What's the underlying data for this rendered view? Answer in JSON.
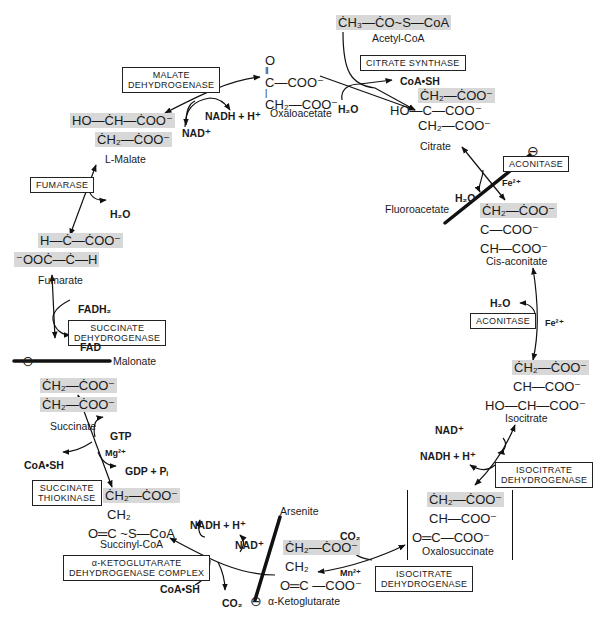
{
  "diagram": {
    "metabolites": {
      "acetyl_coa": {
        "formula": "ĊH₃—ĊO~S—CoA",
        "name": "Acetyl-CoA"
      },
      "oxaloacetate": {
        "line1": "O",
        "line2": "‖",
        "line3": "C—COO⁻",
        "line4": "|",
        "line5": "CH₂—COO⁻",
        "name": "Oxaloacetate"
      },
      "citrate": {
        "line1": "ĊH₂—ĊOO⁻",
        "line2": "HO—C—COO⁻",
        "line3": "CH₂—COO⁻",
        "name": "Citrate"
      },
      "cis_aconitate": {
        "line1": "ĊH₂—ĊOO⁻",
        "line2": "C—COO⁻",
        "line3": "CH—COO⁻",
        "name": "Cis-aconitate"
      },
      "isocitrate": {
        "line1": "ĊH₂—ĊOO⁻",
        "line2": "CH—COO⁻",
        "line3": "HO—CH—COO⁻",
        "name": "Isocitrate"
      },
      "oxalosuccinate": {
        "line1": "ĊH₂—ĊOO⁻",
        "line2": "CH—COO⁻",
        "line3": "O═C—COO⁻",
        "name": "Oxalosuccinate"
      },
      "alpha_ketoglutarate": {
        "line1": "ĊH₂—ĊOO⁻",
        "line2": "CH₂",
        "line3": "O═C —COO⁻",
        "name": "α-Ketoglutarate"
      },
      "succinyl_coa": {
        "line1": "ĊH₂—ĊOO⁻",
        "line2": "CH₂",
        "line3": "O═C ~S—CoA",
        "name": "Succinyl-CoA"
      },
      "succinate": {
        "line1": "ĊH₂—ĊOO⁻",
        "line2": "ĊH₂—ĊOO⁻",
        "name": "Succinate"
      },
      "fumarate": {
        "line1": "H—Ċ—ĊOO⁻",
        "line2": "⁻OOĊ—Ċ—H",
        "name": "Fumarate"
      },
      "malate": {
        "line1": "HO—ĊH—ĊOO⁻",
        "line2": "ĊH₂—ĊOO⁻",
        "name": "L-Malate"
      }
    },
    "enzymes": {
      "citrate_synthase": "CITRATE SYNTHASE",
      "aconitase_1": "ACONITASE",
      "aconitase_2": "ACONITASE",
      "isocitrate_dh_1_l1": "ISOCITRATE",
      "isocitrate_dh_1_l2": "DEHYDROGENASE",
      "isocitrate_dh_2_l1": "ISOCITRATE",
      "isocitrate_dh_2_l2": "DEHYDROGENASE",
      "akg_dh_l1": "α-KETOGLUTARATE",
      "akg_dh_l2": "DEHYDROGENASE COMPLEX",
      "succ_thiokinase_l1": "SUCCINATE",
      "succ_thiokinase_l2": "THIOKINASE",
      "succ_dh_l1": "SUCCINATE",
      "succ_dh_l2": "DEHYDROGENASE",
      "fumarase": "FUMARASE",
      "malate_dh_l1": "MALATE",
      "malate_dh_l2": "DEHYDROGENASE"
    },
    "cofactors": {
      "coash_top": "CoA•SH",
      "h2o_top": "H₂O",
      "nadh_malate": "NADH + H⁺",
      "nad_malate": "NAD⁺",
      "h2o_fumarase": "H₂O",
      "h2o_aconitase1": "H₂O",
      "fe_1": "Fe²⁺",
      "h2o_aconitase2": "H₂O",
      "fe_2": "Fe²⁺",
      "nad_isocitrate": "NAD⁺",
      "nadh_isocitrate": "NADH + H⁺",
      "co2_oxalosuccinate": "CO₂",
      "mn": "Mn²⁺",
      "nadh_akg": "NADH + H⁺",
      "nad_akg": "NAD⁺",
      "coash_akg": "CoA•SH",
      "co2_akg": "CO₂",
      "gtp": "GTP",
      "mg": "Mg²⁺",
      "gdp": "GDP + Pᵢ",
      "coash_succ": "CoA•SH",
      "fadh2": "FADH₂",
      "fad": "FAD"
    },
    "inhibitors": {
      "fluoroacetate": "Fluoroacetate",
      "malonate": "Malonate",
      "arsenite": "Arsenite",
      "symbol": "⊖"
    }
  }
}
